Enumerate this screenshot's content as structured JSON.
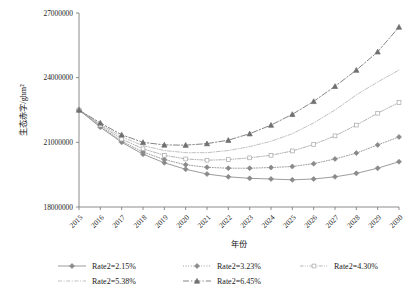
{
  "chart_data": {
    "type": "line",
    "title": "",
    "xlabel": "年份",
    "ylabel": "生态赤字/ghm2",
    "ylabel_display": "生态赤字/ghm²",
    "ylim": [
      18000000,
      27000000
    ],
    "yticks": [
      "18000000",
      "21000000",
      "24000000",
      "27000000"
    ],
    "grid": false,
    "legend_position": "bottom",
    "x": [
      "2015",
      "2016",
      "2017",
      "2018",
      "2019",
      "2020",
      "2021",
      "2022",
      "2023",
      "2024",
      "2025",
      "2026",
      "2027",
      "2028",
      "2029",
      "2030"
    ],
    "series": [
      {
        "name": "Rate2=2.15%",
        "marker": "diamond",
        "dash": "solid",
        "color": "#8a8a8a",
        "values": [
          22500000,
          21700000,
          21000000,
          20450000,
          20050000,
          19750000,
          19530000,
          19400000,
          19330000,
          19300000,
          19260000,
          19300000,
          19400000,
          19560000,
          19800000,
          20100000
        ]
      },
      {
        "name": "Rate2=3.23%",
        "marker": "diamond",
        "dash": "dotted",
        "color": "#8a8a8a",
        "values": [
          22500000,
          21750000,
          21050000,
          20550000,
          20200000,
          19960000,
          19840000,
          19800000,
          19800000,
          19830000,
          19880000,
          20010000,
          20230000,
          20500000,
          20880000,
          21250000
        ]
      },
      {
        "name": "Rate2=4.30%",
        "marker": "square",
        "dash": "dashdotdot",
        "color": "#a6a6a6",
        "values": [
          22500000,
          21800000,
          21150000,
          20700000,
          20400000,
          20230000,
          20170000,
          20200000,
          20280000,
          20400000,
          20600000,
          20900000,
          21300000,
          21800000,
          22350000,
          22850000
        ]
      },
      {
        "name": "Rate2=5.38%",
        "marker": "none",
        "dash": "dashdot",
        "color": "#b5b5b5",
        "values": [
          22500000,
          21850000,
          21250000,
          20850000,
          20620000,
          20520000,
          20520000,
          20620000,
          20800000,
          21050000,
          21400000,
          21900000,
          22500000,
          23200000,
          23800000,
          24350000
        ]
      },
      {
        "name": "Rate2=6.45%",
        "marker": "triangle",
        "dash": "longdashdot",
        "color": "#6f6f6f",
        "values": [
          22500000,
          21900000,
          21350000,
          21000000,
          20880000,
          20870000,
          20940000,
          21100000,
          21400000,
          21800000,
          22300000,
          22900000,
          23600000,
          24350000,
          25200000,
          26350000
        ]
      }
    ]
  },
  "legend": {
    "items": [
      {
        "label": "Rate2=2.15%"
      },
      {
        "label": "Rate2=3.23%"
      },
      {
        "label": "Rate2=4.30%"
      },
      {
        "label": "Rate2=5.38%"
      },
      {
        "label": "Rate2=6.45%"
      }
    ]
  }
}
